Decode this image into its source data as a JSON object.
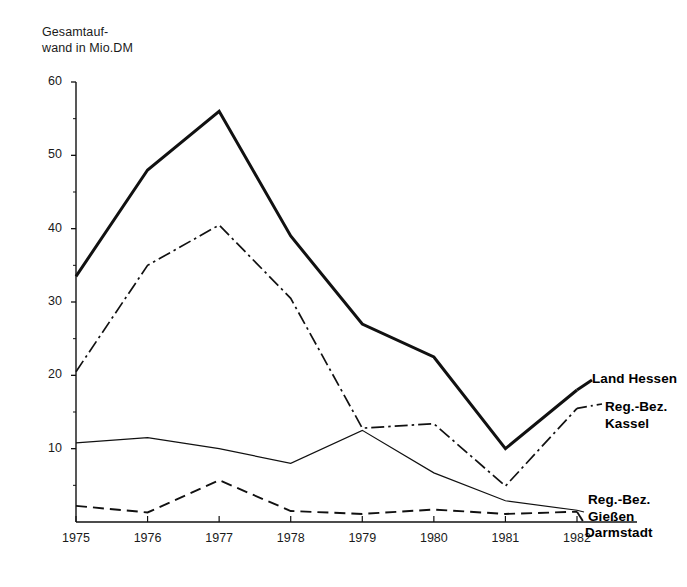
{
  "axis_caption": "Gesamtauf-\nwand in Mio.DM",
  "y_axis": {
    "labels": [
      "60",
      "50",
      "40",
      "30",
      "20",
      "10"
    ],
    "values": [
      60,
      50,
      40,
      30,
      20,
      10
    ]
  },
  "x_axis": {
    "labels": [
      "1975",
      "1976",
      "1977",
      "1978",
      "1979",
      "1980",
      "1981",
      "1982"
    ]
  },
  "series_labels": {
    "land_hessen": "Land Hessen",
    "kassel": "Reg.-Bez.\nKassel",
    "giessen": "Reg.-Bez.\nGießen",
    "darmstadt": "Darmstadt"
  },
  "colors": {
    "ink": "#111111",
    "background": "#ffffff"
  },
  "chart_data": {
    "type": "line",
    "title": "",
    "xlabel": "",
    "ylabel": "Gesamtaufwand in Mio.DM",
    "x": [
      1975,
      1976,
      1977,
      1978,
      1979,
      1980,
      1981,
      1982
    ],
    "categories": [
      "1975",
      "1976",
      "1977",
      "1978",
      "1979",
      "1980",
      "1981",
      "1982"
    ],
    "ylim": [
      0,
      60
    ],
    "yticks": [
      10,
      20,
      30,
      40,
      50,
      60
    ],
    "yticks_minor": [
      5,
      15,
      25,
      35,
      45,
      55
    ],
    "grid": false,
    "legend": "inline-right",
    "series": [
      {
        "name": "Land Hessen",
        "style": "solid-bold",
        "values": [
          33.5,
          48.0,
          56.0,
          39.0,
          27.0,
          22.5,
          10.0,
          18.0
        ]
      },
      {
        "name": "Reg.-Bez. Kassel",
        "style": "dash-dot",
        "values": [
          20.5,
          35.0,
          40.5,
          30.5,
          12.8,
          13.4,
          4.9,
          15.5
        ]
      },
      {
        "name": "Reg.-Bez. Gießen",
        "style": "solid-thin",
        "values": [
          10.8,
          11.5,
          10.0,
          8.0,
          12.5,
          6.7,
          2.9,
          1.6
        ]
      },
      {
        "name": "Darmstadt",
        "style": "dashed",
        "values": [
          2.2,
          1.3,
          5.7,
          1.5,
          1.1,
          1.7,
          1.1,
          1.4
        ]
      }
    ]
  }
}
